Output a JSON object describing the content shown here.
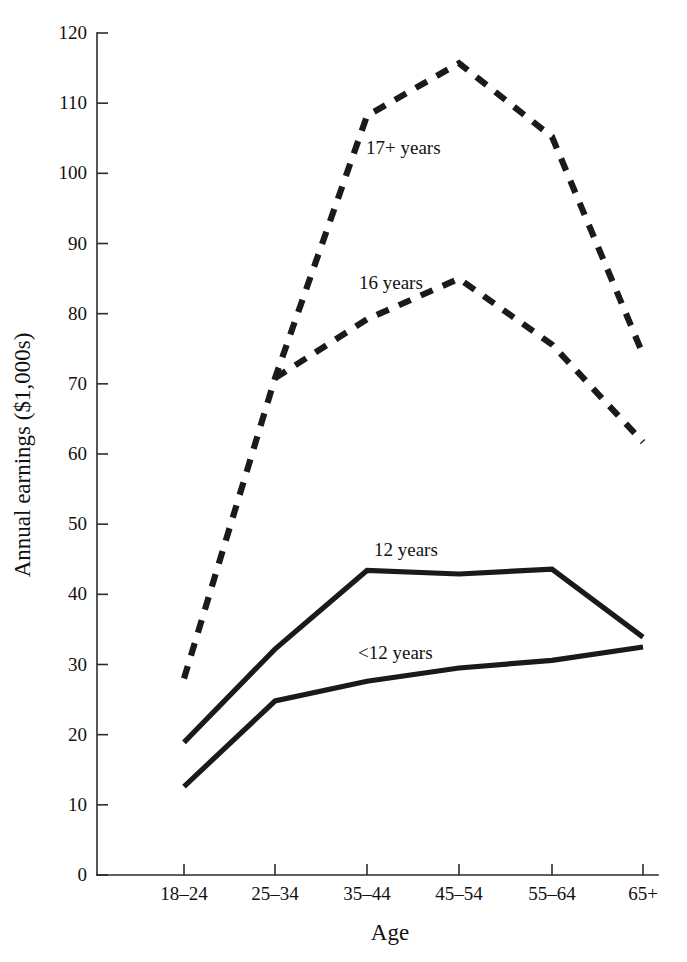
{
  "chart_data": {
    "type": "line",
    "title": "",
    "xlabel": "Age",
    "ylabel": "Annual earnings ($1,000s)",
    "categories": [
      "18–24",
      "25–34",
      "35–44",
      "45–54",
      "55–64",
      "65+"
    ],
    "ylim": [
      0,
      120
    ],
    "yticks": [
      0,
      10,
      20,
      30,
      40,
      50,
      60,
      70,
      80,
      90,
      100,
      110,
      120
    ],
    "ytick_labels": [
      "0",
      "10",
      "20",
      "30",
      "40",
      "50",
      "60",
      "70",
      "80",
      "90",
      "100",
      "110",
      "120"
    ],
    "grid": false,
    "legend_position": "inline-annotations",
    "series": [
      {
        "name": "17+ years",
        "label": "17+ years",
        "style": "dashed",
        "x": [
          "18–24",
          "25–34",
          "35–44",
          "45–54",
          "55–64",
          "65+"
        ],
        "values": [
          28.0,
          70.8,
          108.2,
          115.7,
          105.2,
          74.2
        ],
        "annotation": {
          "text": "17+ years",
          "x_px": 366,
          "y_px": 154
        }
      },
      {
        "name": "16 years",
        "label": "16 years",
        "style": "dashed",
        "x": [
          "18–24",
          "25–34",
          "35–44",
          "45–54",
          "55–64",
          "65+"
        ],
        "values": [
          null,
          70.8,
          79.2,
          85.0,
          75.6,
          61.7
        ],
        "annotation": {
          "text": "16 years",
          "x_px": 359,
          "y_px": 289
        }
      },
      {
        "name": "12 years",
        "label": "12 years",
        "style": "solid",
        "x": [
          "18–24",
          "25–34",
          "35–44",
          "45–54",
          "55–64",
          "65+"
        ],
        "values": [
          18.9,
          32.2,
          43.4,
          42.9,
          43.6,
          33.9
        ],
        "annotation": {
          "text": "12 years",
          "x_px": 374,
          "y_px": 556
        }
      },
      {
        "name": "<12 years",
        "label": "<12 years",
        "style": "solid",
        "x": [
          "18–24",
          "25–34",
          "35–44",
          "45–54",
          "55–64",
          "65+"
        ],
        "values": [
          12.6,
          24.8,
          27.6,
          29.5,
          30.6,
          32.5
        ],
        "annotation": {
          "text": "<12 years",
          "x_px": 358,
          "y_px": 659
        }
      }
    ]
  },
  "axes": {
    "x_tick_px": [
      184,
      275,
      367,
      459,
      552,
      643
    ],
    "origin_px": {
      "x": 97,
      "y": 875
    },
    "y_top_px": 33,
    "y_axis_title_pos": {
      "x": 30,
      "y": 455
    },
    "x_axis_title_pos": {
      "x": 390,
      "y": 940
    }
  }
}
